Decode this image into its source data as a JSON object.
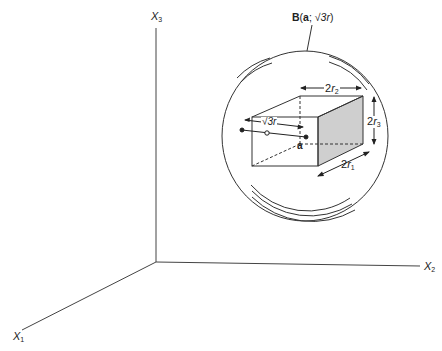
{
  "diagram": {
    "type": "geometry-3d",
    "axes": {
      "x1": {
        "name": "X",
        "sub": "1"
      },
      "x2": {
        "name": "X",
        "sub": "2"
      },
      "x3": {
        "name": "X",
        "sub": "3"
      }
    },
    "ball_label": {
      "bold": "B",
      "open": "(",
      "center": "a",
      "sep": "; ",
      "radius": "√3r",
      "close": ")"
    },
    "box": {
      "dim_r1": {
        "coef": "2",
        "var": "r",
        "sub": "1"
      },
      "dim_r2": {
        "coef": "2",
        "var": "r",
        "sub": "2"
      },
      "dim_r3": {
        "coef": "2",
        "var": "r",
        "sub": "3"
      },
      "center_label": "a",
      "diag_label": "√3r"
    },
    "colors": {
      "line": "#333333",
      "shade": "#cfcfcf",
      "background": "#ffffff"
    }
  }
}
